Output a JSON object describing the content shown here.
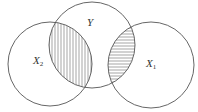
{
  "diagram": {
    "type": "venn",
    "stroke_color": "#555555",
    "background": "#ffffff",
    "sets": [
      {
        "id": "X2",
        "label": "X",
        "subscript": "2",
        "cx": 50,
        "cy": 64,
        "r": 42
      },
      {
        "id": "Y",
        "label": "Y",
        "subscript": "",
        "cx": 92,
        "cy": 45,
        "r": 43
      },
      {
        "id": "X1",
        "label": "X",
        "subscript": "1",
        "cx": 151,
        "cy": 65,
        "r": 43
      }
    ],
    "shaded_regions": [
      {
        "intersection": [
          "X2",
          "Y"
        ],
        "hatch": "vertical"
      },
      {
        "intersection": [
          "Y",
          "X1"
        ],
        "hatch": "horizontal"
      }
    ],
    "labels": {
      "x2": {
        "main": "X",
        "sub": "2"
      },
      "y": {
        "main": "Y"
      },
      "x1": {
        "main": "X",
        "sub": "1"
      }
    }
  }
}
